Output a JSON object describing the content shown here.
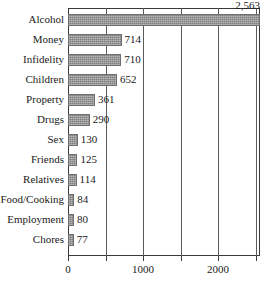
{
  "chart_data": {
    "type": "bar",
    "orientation": "horizontal",
    "title": "",
    "subtitle": "",
    "xlabel": "",
    "ylabel": "",
    "xlim": [
      0,
      2560
    ],
    "grid": true,
    "legend": null,
    "categories": [
      "Alcohol",
      "Money",
      "Infidelity",
      "Children",
      "Property",
      "Drugs",
      "Sex",
      "Friends",
      "Relatives",
      "Food/Cooking",
      "Employment",
      "Chores"
    ],
    "values": [
      2563,
      714,
      710,
      652,
      361,
      290,
      130,
      125,
      114,
      84,
      80,
      77
    ],
    "value_labels": [
      "2,563",
      "714",
      "710",
      "652",
      "361",
      "290",
      "130",
      "125",
      "114",
      "84",
      "80",
      "77"
    ],
    "xticks": [
      0,
      500,
      1000,
      1500,
      2000,
      2500
    ],
    "xtick_labels": [
      "0",
      "",
      "1000",
      "",
      "2000",
      ""
    ],
    "bar_color": "#9a9a9a",
    "bar_edge_color": "#6f6f6f",
    "axis_color": "#3a3a3a",
    "text_color": "#1a1a1a"
  }
}
